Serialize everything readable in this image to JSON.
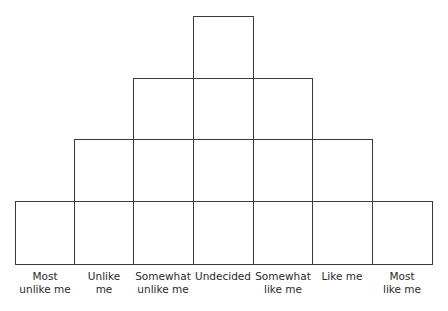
{
  "diagram": {
    "type": "q-sort-grid",
    "columns": [
      {
        "label_line1": "Most",
        "label_line2": "unlike me",
        "cells": 1
      },
      {
        "label_line1": "Unlike",
        "label_line2": "me",
        "cells": 2
      },
      {
        "label_line1": "Somewhat",
        "label_line2": "unlike me",
        "cells": 3
      },
      {
        "label_line1": "Undecided",
        "label_line2": "",
        "cells": 4
      },
      {
        "label_line1": "Somewhat",
        "label_line2": "like me",
        "cells": 3
      },
      {
        "label_line1": "Like me",
        "label_line2": "",
        "cells": 2
      },
      {
        "label_line1": "Most",
        "label_line2": "like me",
        "cells": 1
      }
    ],
    "line_color": "#3a3a3a"
  }
}
